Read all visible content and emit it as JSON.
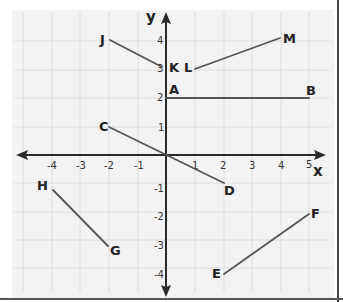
{
  "diagram": {
    "type": "coordinate-plane",
    "axes": {
      "x_label": "x",
      "y_label": "y",
      "x_ticks": [
        "-4",
        "-3",
        "-2",
        "-1",
        "1",
        "2",
        "3",
        "4",
        "5"
      ],
      "y_ticks": [
        "4",
        "3",
        "2",
        "1",
        "-1",
        "-2",
        "-3",
        "-4"
      ],
      "x_range": [
        -4,
        5
      ],
      "y_range": [
        -4,
        4
      ]
    },
    "points": [
      {
        "label": "A",
        "x": 0,
        "y": 2
      },
      {
        "label": "B",
        "x": 5,
        "y": 2
      },
      {
        "label": "C",
        "x": -2,
        "y": 1
      },
      {
        "label": "D",
        "x": 2,
        "y": -1
      },
      {
        "label": "E",
        "x": 2,
        "y": -4
      },
      {
        "label": "F",
        "x": 5,
        "y": -2
      },
      {
        "label": "G",
        "x": -2,
        "y": -3
      },
      {
        "label": "H",
        "x": -4,
        "y": -1
      },
      {
        "label": "J",
        "x": -2,
        "y": 4
      },
      {
        "label": "K",
        "x": 0,
        "y": 3
      },
      {
        "label": "L",
        "x": 1,
        "y": 3
      },
      {
        "label": "M",
        "x": 4,
        "y": 4
      }
    ],
    "segments": [
      {
        "name": "AB",
        "from": "A",
        "to": "B"
      },
      {
        "name": "CD",
        "from": "C",
        "to": "D"
      },
      {
        "name": "EF",
        "from": "E",
        "to": "F"
      },
      {
        "name": "GH",
        "from": "G",
        "to": "H"
      },
      {
        "name": "JK",
        "from": "J",
        "to": "K"
      },
      {
        "name": "LM",
        "from": "L",
        "to": "M"
      }
    ],
    "colors": {
      "background": "#f3f3f3",
      "grid": "#dcdcdc",
      "axis": "#2a2a2a",
      "segment": "#555555",
      "border": "#444444"
    }
  }
}
